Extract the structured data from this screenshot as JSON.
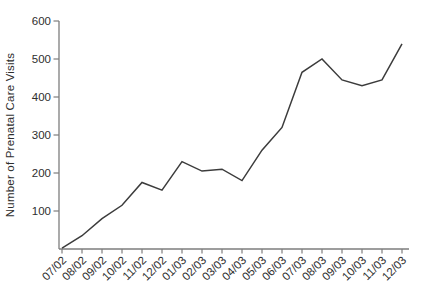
{
  "chart_data": {
    "type": "line",
    "title": "",
    "xlabel": "",
    "ylabel": "Number of Prenatal Care Visits",
    "categories": [
      "07/02",
      "08/02",
      "09/02",
      "10/02",
      "11/02",
      "12/02",
      "01/03",
      "02/03",
      "03/03",
      "04/03",
      "05/03",
      "06/03",
      "07/03",
      "08/03",
      "09/03",
      "10/03",
      "11/03",
      "12/03"
    ],
    "series": [
      {
        "name": "Prenatal care visits",
        "values": [
          2,
          35,
          80,
          115,
          175,
          155,
          230,
          205,
          210,
          180,
          260,
          320,
          465,
          500,
          445,
          430,
          445,
          540
        ]
      }
    ],
    "ylim": [
      0,
      600
    ],
    "yticks": [
      100,
      200,
      300,
      400,
      500,
      600
    ],
    "grid": false,
    "legend": "none",
    "x_tick_rotation_deg": -45,
    "colors": {
      "line": "#3c3c3c",
      "axis": "#7d7d7d",
      "text": "#2e2e2e",
      "background": "#ffffff"
    }
  }
}
